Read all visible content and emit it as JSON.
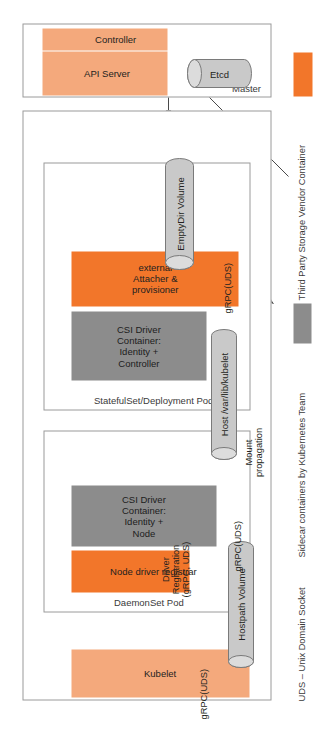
{
  "diagram": {
    "colors": {
      "vendor_orange": "#f2762a",
      "kubelet_orange": "#f4a97c",
      "sidecar_gray": "#8c8c8c",
      "cylinder_gray": "#c9c9c9",
      "panel_border": "#9a9a9a",
      "text": "#231f20"
    }
  },
  "worker": {
    "label": "Worker",
    "kubelet": {
      "label": "Kubelet"
    },
    "daemonset_pod": {
      "label": "DaemonSet Pod",
      "node_driver_registrar": {
        "label": "Node driver registrar"
      },
      "csi_driver_container": {
        "label": "CSI Driver\nContainer:\nIdentity + Node"
      }
    },
    "statefulset_pod": {
      "label": "StatefulSet/Deployment Pod",
      "external_attacher": {
        "label": "external\nAttacher & provisioner"
      },
      "csi_driver_container": {
        "label": "CSI Driver\nContainer:\nIdentity + Controller"
      }
    },
    "volumes": {
      "hostpath": {
        "label": "Hostpath Volume"
      },
      "host_kubelet_dir": {
        "label": "Host /var/lib/kubelet"
      },
      "emptydir": {
        "label": "EmptyDir Volume"
      }
    }
  },
  "master": {
    "label": "Master",
    "controller": {
      "label": "Controller"
    },
    "api_server": {
      "label": "API Server"
    },
    "etcd": {
      "label": "Etcd"
    }
  },
  "annotations": {
    "grpc_uds_kubelet": "gRPC(UDS)",
    "grpc_uds_registrar": "gRPC(UDS)",
    "grpc_uds_emptydir": "gRPC(UDS)",
    "driver_registration": "Driver\nRegistration\n(gRPC, UDS)",
    "mount_propagation": "Mount\npropagation"
  },
  "legend": {
    "sidecar": {
      "label": "Sidecar containers by Kubernetes Team",
      "color": "#8c8c8c"
    },
    "vendor": {
      "label": "Third Party Storage Vendor Container",
      "color": "#f2762a"
    },
    "uds": {
      "label": "UDS – Unix Domain Socket"
    }
  }
}
